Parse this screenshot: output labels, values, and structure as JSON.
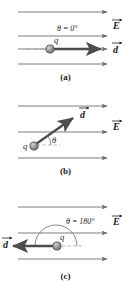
{
  "figure": {
    "colors": {
      "field_line": "#6b6b6b",
      "displacement_vector": "#4d4d4d",
      "charge_fill": "#9a9a9a",
      "charge_stroke": "#4a4a4a",
      "dashed_guide": "#a8a8a8",
      "arc": "#6b6b6b",
      "text": "#1a1a1a",
      "background": "#ffffff"
    }
  },
  "panels": [
    {
      "id": "a",
      "caption": "(a)",
      "theta_label": "θ = 0°",
      "field_label": "E",
      "displacement_label": "d",
      "charge_label": "q",
      "field_line_count": 4,
      "displacement_direction": "right",
      "angle_degrees": 0
    },
    {
      "id": "b",
      "caption": "(b)",
      "theta_label": "θ",
      "field_label": "E",
      "displacement_label": "d",
      "charge_label": "q",
      "field_line_count": 3,
      "displacement_direction": "up-right",
      "angle_degrees": 35
    },
    {
      "id": "c",
      "caption": "(c)",
      "theta_label": "θ = 180°",
      "field_label": "E",
      "displacement_label": "d",
      "charge_label": "q",
      "field_line_count": 3,
      "displacement_direction": "left",
      "angle_degrees": 180
    }
  ]
}
